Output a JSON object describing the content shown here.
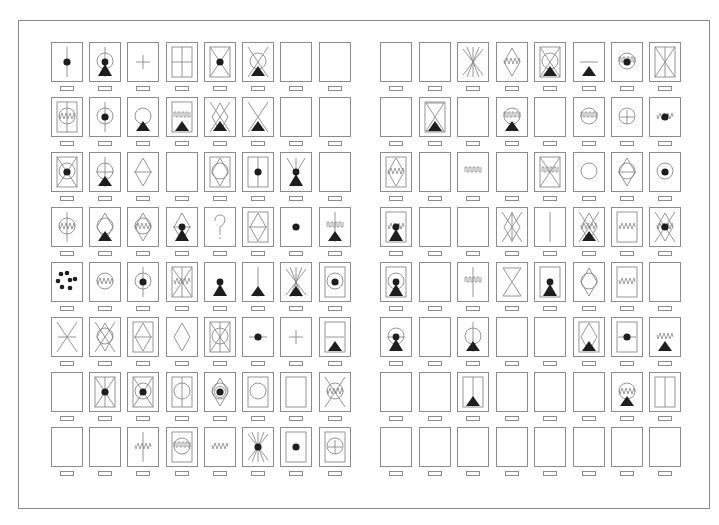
{
  "colors": {
    "stroke": "#8a8a8a",
    "fill": "#1e1e1e",
    "frame": "#8a8a8a",
    "background": "#ffffff"
  },
  "layout": {
    "panels": [
      {
        "name": "left-panel",
        "col_x": [
          51,
          89,
          127,
          166,
          204,
          242,
          280,
          319
        ]
      },
      {
        "name": "right-panel",
        "col_x": [
          380,
          419,
          457,
          496,
          534,
          573,
          611,
          649
        ]
      }
    ],
    "row_y": [
      42,
      97,
      152,
      207,
      262,
      317,
      372,
      427
    ]
  },
  "panels": [
    {
      "name": "left-panel",
      "rows": [
        [
          [
            "vline",
            "dot"
          ],
          [
            "vline",
            "ring",
            "pawn"
          ],
          [
            "plus"
          ],
          [
            "inner",
            "grid"
          ],
          [
            "inner",
            "xcross",
            "dot"
          ],
          [
            "xcross",
            "ring",
            "tri"
          ],
          [],
          []
        ],
        [
          [
            "inner",
            "ring",
            "vline",
            "wave"
          ],
          [
            "vline",
            "ring",
            "dot"
          ],
          [
            "ring",
            "tri"
          ],
          [
            "inner",
            "comb",
            "tri"
          ],
          [
            "xcross",
            "diamond",
            "tri"
          ],
          [
            "xcross",
            "tri"
          ],
          [],
          []
        ],
        [
          [
            "inner",
            "xcross",
            "ring",
            "dot"
          ],
          [
            "vline",
            "ring",
            "hline",
            "tri"
          ],
          [
            "diamond",
            "hline"
          ],
          [],
          [
            "inner",
            "diamond",
            "ring"
          ],
          [
            "inner",
            "vline",
            "dot"
          ],
          [
            "vee",
            "pawn"
          ],
          []
        ],
        [
          [
            "ring",
            "vline",
            "wave"
          ],
          [
            "diamond",
            "ring",
            "tri"
          ],
          [
            "diamond",
            "ring",
            "wave"
          ],
          [
            "diamond",
            "hline",
            "pawn"
          ],
          [
            "q"
          ],
          [
            "inner",
            "diamond",
            "hline"
          ],
          [
            "dot"
          ],
          [
            "vline",
            "comb",
            "tri"
          ]
        ],
        [
          [
            "dots"
          ],
          [
            "ring",
            "wave"
          ],
          [
            "vline",
            "ring",
            "dot"
          ],
          [
            "inner",
            "xcross",
            "vline",
            "wave"
          ],
          [
            "pawn"
          ],
          [
            "vline",
            "tri"
          ],
          [
            "star",
            "tri"
          ],
          [
            "inner",
            "ring",
            "dot"
          ]
        ],
        [
          [
            "xcross",
            "hline"
          ],
          [
            "xcross",
            "ring",
            "diamond"
          ],
          [
            "inner",
            "diamond",
            "hline"
          ],
          [
            "diamond"
          ],
          [
            "inner",
            "xcross",
            "ring",
            "vline"
          ],
          [
            "hline",
            "dot"
          ],
          [
            "plus"
          ],
          [
            "inner",
            "hline",
            "tri"
          ]
        ],
        [
          [],
          [
            "inner",
            "xcross",
            "vline",
            "dot"
          ],
          [
            "inner",
            "xcross",
            "ring",
            "dot"
          ],
          [
            "inner",
            "ring",
            "vline"
          ],
          [
            "diamond",
            "ring",
            "ring2",
            "dot"
          ],
          [
            "inner",
            "ring"
          ],
          [
            "inner"
          ],
          [
            "xcross",
            "ring",
            "wave"
          ]
        ],
        [
          [],
          [],
          [
            "vline",
            "wave"
          ],
          [
            "inner",
            "ring",
            "comb"
          ],
          [
            "wave"
          ],
          [
            "star",
            "dot"
          ],
          [
            "inner",
            "dot"
          ],
          [
            "inner",
            "ring",
            "plus"
          ]
        ]
      ]
    },
    {
      "name": "right-panel",
      "rows": [
        [
          [],
          [],
          [
            "star"
          ],
          [
            "diamond",
            "wave"
          ],
          [
            "inner",
            "xcross",
            "ring",
            "tri"
          ],
          [
            "hline",
            "tri"
          ],
          [
            "ring",
            "comb",
            "dot"
          ],
          [
            "inner",
            "xcross",
            "vline"
          ]
        ],
        [
          [],
          [
            "inner",
            "hourglass",
            "tri"
          ],
          [],
          [
            "ring",
            "comb",
            "tri"
          ],
          [],
          [
            "ring",
            "comb"
          ],
          [
            "ring",
            "plus"
          ],
          [
            "wave",
            "dot"
          ]
        ],
        [
          [
            "inner",
            "diamond",
            "wave"
          ],
          [],
          [
            "comb"
          ],
          [],
          [
            "inner",
            "xcross",
            "comb"
          ],
          [
            "ring"
          ],
          [
            "diamond",
            "ring",
            "hline"
          ],
          [
            "ring",
            "dot"
          ]
        ],
        [
          [
            "inner",
            "wave",
            "pawn"
          ],
          [],
          [],
          [
            "xcross",
            "diamond",
            "vline"
          ],
          [
            "vline"
          ],
          [
            "xcross",
            "diamond",
            "wave",
            "tri"
          ],
          [
            "inner",
            "wave"
          ],
          [
            "xcross",
            "diamond",
            "wave",
            "dot"
          ]
        ],
        [
          [
            "inner",
            "ring",
            "pawn"
          ],
          [],
          [
            "vline",
            "comb"
          ],
          [
            "hourglass"
          ],
          [
            "inner",
            "pawn"
          ],
          [
            "diamond",
            "ring"
          ],
          [
            "inner",
            "wave"
          ],
          []
        ],
        [
          [
            "ring",
            "hline",
            "pawn"
          ],
          [],
          [
            "vline",
            "ring",
            "tri"
          ],
          [],
          [],
          [
            "inner",
            "diamond",
            "tri"
          ],
          [
            "inner",
            "hline",
            "dot"
          ],
          [
            "wave",
            "tri"
          ]
        ],
        [
          [],
          [],
          [
            "inner",
            "vline",
            "tri"
          ],
          [],
          [],
          [],
          [
            "ring",
            "wave",
            "tri"
          ],
          [
            "inner",
            "vline"
          ]
        ],
        [
          [],
          [],
          [],
          [],
          [],
          [],
          [],
          []
        ]
      ]
    }
  ]
}
